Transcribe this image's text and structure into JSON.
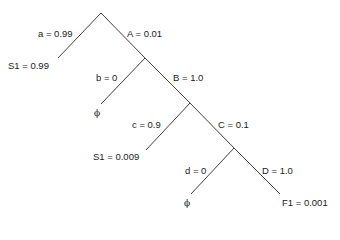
{
  "diagram": {
    "type": "probability-tree",
    "edges": [
      {
        "id": "a",
        "label": "a = 0.99",
        "from": "root",
        "to": "leaf-s1-a"
      },
      {
        "id": "A",
        "label": "A = 0.01",
        "from": "root",
        "to": "node-1"
      },
      {
        "id": "b",
        "label": "b = 0",
        "from": "node-1",
        "to": "leaf-phi-b"
      },
      {
        "id": "B",
        "label": "B = 1.0",
        "from": "node-1",
        "to": "node-2"
      },
      {
        "id": "c",
        "label": "c = 0.9",
        "from": "node-2",
        "to": "leaf-s1-c"
      },
      {
        "id": "C",
        "label": "C = 0.1",
        "from": "node-2",
        "to": "node-3"
      },
      {
        "id": "d",
        "label": "d = 0",
        "from": "node-3",
        "to": "leaf-phi-d"
      },
      {
        "id": "D",
        "label": "D = 1.0",
        "from": "node-3",
        "to": "leaf-f1"
      }
    ],
    "leaves": [
      {
        "id": "leaf-s1-a",
        "label": "S1 = 0.99"
      },
      {
        "id": "leaf-phi-b",
        "label": "ϕ"
      },
      {
        "id": "leaf-s1-c",
        "label": "S1 = 0.009"
      },
      {
        "id": "leaf-phi-d",
        "label": "ϕ"
      },
      {
        "id": "leaf-f1",
        "label": "F1 = 0.001"
      }
    ]
  }
}
